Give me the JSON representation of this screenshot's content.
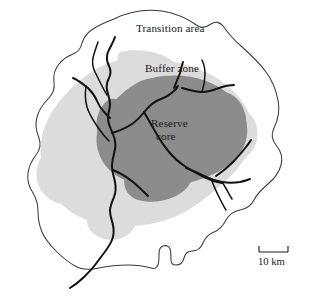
{
  "figure": {
    "type": "map-diagram"
  },
  "labels": {
    "transition_area": "Transition area",
    "buffer_zone": "Buffer zone",
    "reserve_core_line1": "Reserve",
    "reserve_core_line2": "core"
  },
  "scale": {
    "label": "10 km",
    "distance_value": "10",
    "distance_unit": "km"
  },
  "colors": {
    "background": "#ffffff",
    "transition_area_fill": "#ffffff",
    "buffer_zone_fill": "#dcdcdc",
    "reserve_core_fill": "#8c8c8c",
    "outline_stroke": "#3a3a3a",
    "river_stroke": "#121212",
    "text": "#1a1a1a"
  },
  "zones": [
    {
      "name": "transition-area",
      "label": "Transition area",
      "fill": "#ffffff"
    },
    {
      "name": "buffer-zone",
      "label": "Buffer zone",
      "fill": "#dcdcdc"
    },
    {
      "name": "reserve-core",
      "label": "Reserve core",
      "fill": "#8c8c8c"
    }
  ],
  "features": {
    "rivers_count": 6,
    "river_names": [
      "main-north-river",
      "north-tributary",
      "west-tributary",
      "northeast-river",
      "east-river",
      "southeast-tributary"
    ]
  }
}
